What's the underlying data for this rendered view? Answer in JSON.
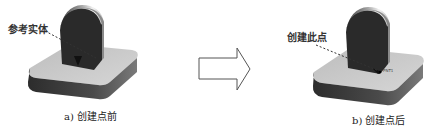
{
  "panel_a": {
    "callout": "参考实体",
    "caption": "a) 创建点前"
  },
  "panel_b": {
    "callout": "创建此点",
    "point_label": "PNT1",
    "caption": "b) 创建点后"
  },
  "transition": {
    "icon": "right-arrow-icon"
  },
  "colors": {
    "base_top": "#c8c8c8",
    "base_side": "#3a3a3a",
    "boss_front": "#2a2a2a",
    "boss_top": "#e8e8e8",
    "arrow_stroke": "#555555",
    "leader": "#333333"
  }
}
